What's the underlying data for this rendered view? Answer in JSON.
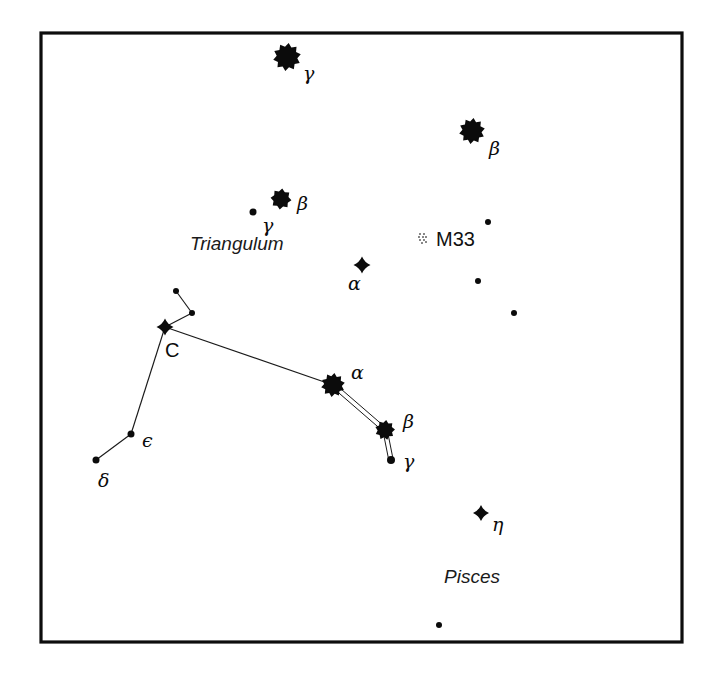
{
  "figure": {
    "kind": "star-chart",
    "background_color": "#ffffff",
    "ink_color": "#0b0b0b",
    "frame": {
      "x": 41,
      "y": 33,
      "width": 641,
      "height": 609,
      "stroke": "#0d0d0d",
      "stroke_width": 3.2
    }
  },
  "chart_data": {
    "type": "scatter",
    "title": "",
    "xlabel": "",
    "ylabel": "",
    "grid": false,
    "legend_position": "none",
    "constellations": [
      "Triangulum",
      "Pisces"
    ],
    "stars": [
      {
        "id": "and-gamma",
        "label": "γ",
        "label_kind": "greek",
        "marker": "star-10",
        "size": 28,
        "x": 287,
        "y": 57,
        "label_x": 303,
        "label_y": 80,
        "constellation": "Andromeda"
      },
      {
        "id": "and-beta",
        "label": "β",
        "label_kind": "greek",
        "marker": "star-10",
        "size": 26,
        "x": 472,
        "y": 131,
        "label_x": 489,
        "label_y": 155,
        "constellation": "Andromeda"
      },
      {
        "id": "tri-beta",
        "label": "β",
        "label_kind": "greek",
        "marker": "star-8",
        "size": 21,
        "x": 281,
        "y": 199,
        "label_x": 297,
        "label_y": 210,
        "constellation": "Triangulum"
      },
      {
        "id": "tri-gamma",
        "label": "γ",
        "label_kind": "greek",
        "marker": "dot",
        "size": 7,
        "x": 253,
        "y": 212,
        "label_x": 262,
        "label_y": 232,
        "constellation": "Triangulum"
      },
      {
        "id": "tri-alpha",
        "label": "α",
        "label_kind": "greek",
        "marker": "star-4",
        "size": 17,
        "x": 362,
        "y": 265,
        "label_x": 348,
        "label_y": 290,
        "constellation": "Triangulum"
      },
      {
        "id": "psc-c",
        "label": "C",
        "label_kind": "roman",
        "marker": "star-4",
        "size": 17,
        "x": 165,
        "y": 327,
        "label_x": 165,
        "label_y": 357,
        "constellation": "Pisces"
      },
      {
        "id": "psc-node-a",
        "label": "",
        "label_kind": "none",
        "marker": "dot",
        "size": 6,
        "x": 176,
        "y": 291,
        "label_x": 0,
        "label_y": 0,
        "constellation": "Pisces"
      },
      {
        "id": "psc-node-b",
        "label": "",
        "label_kind": "none",
        "marker": "dot",
        "size": 6,
        "x": 192,
        "y": 313,
        "label_x": 0,
        "label_y": 0,
        "constellation": "Pisces"
      },
      {
        "id": "psc-alpha",
        "label": "α",
        "label_kind": "greek",
        "marker": "star-10",
        "size": 24,
        "x": 333,
        "y": 385,
        "label_x": 351,
        "label_y": 379,
        "constellation": "Pisces"
      },
      {
        "id": "psc-beta",
        "label": "β",
        "label_kind": "greek",
        "marker": "star-9",
        "size": 20,
        "x": 385,
        "y": 430,
        "label_x": 403,
        "label_y": 428,
        "constellation": "Pisces"
      },
      {
        "id": "psc-gamma",
        "label": "γ",
        "label_kind": "greek",
        "marker": "dot",
        "size": 8,
        "x": 391,
        "y": 460,
        "label_x": 403,
        "label_y": 468,
        "constellation": "Pisces"
      },
      {
        "id": "psc-epsilon",
        "label": "ϵ",
        "label_kind": "greek",
        "marker": "dot",
        "size": 7,
        "x": 131,
        "y": 434,
        "label_x": 142,
        "label_y": 447,
        "constellation": "Pisces"
      },
      {
        "id": "psc-delta",
        "label": "δ",
        "label_kind": "greek",
        "marker": "dot",
        "size": 7,
        "x": 96,
        "y": 460,
        "label_x": 98,
        "label_y": 487,
        "constellation": "Pisces"
      },
      {
        "id": "psc-eta",
        "label": "η",
        "label_kind": "greek",
        "marker": "star-4",
        "size": 16,
        "x": 481,
        "y": 513,
        "label_x": 492,
        "label_y": 531,
        "constellation": "Pisces"
      },
      {
        "id": "field-1",
        "label": "",
        "label_kind": "none",
        "marker": "dot",
        "size": 6,
        "x": 488,
        "y": 222,
        "label_x": 0,
        "label_y": 0,
        "constellation": ""
      },
      {
        "id": "field-2",
        "label": "",
        "label_kind": "none",
        "marker": "dot",
        "size": 6,
        "x": 478,
        "y": 281,
        "label_x": 0,
        "label_y": 0,
        "constellation": ""
      },
      {
        "id": "field-3",
        "label": "",
        "label_kind": "none",
        "marker": "dot",
        "size": 6,
        "x": 514,
        "y": 313,
        "label_x": 0,
        "label_y": 0,
        "constellation": ""
      },
      {
        "id": "field-4",
        "label": "",
        "label_kind": "none",
        "marker": "dot",
        "size": 6,
        "x": 439,
        "y": 625,
        "label_x": 0,
        "label_y": 0,
        "constellation": ""
      }
    ],
    "deep_sky_objects": [
      {
        "id": "m33",
        "label": "M33",
        "marker": "galaxy-stipple",
        "x": 423,
        "y": 238,
        "label_x": 436,
        "label_y": 246
      }
    ],
    "constellation_lines": [
      {
        "from": "psc-node-a",
        "to": "psc-node-b",
        "style": "single"
      },
      {
        "from": "psc-node-b",
        "to": "psc-c",
        "style": "single"
      },
      {
        "from": "psc-c",
        "to": "psc-alpha",
        "style": "single"
      },
      {
        "from": "psc-c",
        "to": "psc-epsilon",
        "style": "single"
      },
      {
        "from": "psc-epsilon",
        "to": "psc-delta",
        "style": "single"
      },
      {
        "from": "psc-alpha",
        "to": "psc-beta",
        "style": "double"
      },
      {
        "from": "psc-beta",
        "to": "psc-gamma",
        "style": "double"
      }
    ],
    "constellation_labels": [
      {
        "id": "triangulum-label",
        "text": "Triangulum",
        "x": 190,
        "y": 250
      },
      {
        "id": "pisces-label",
        "text": "Pisces",
        "x": 444,
        "y": 583
      }
    ]
  }
}
